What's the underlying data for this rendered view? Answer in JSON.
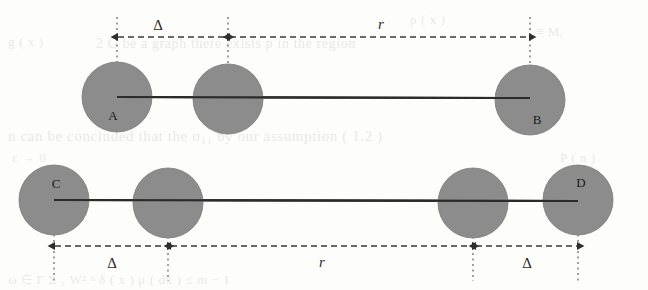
{
  "figure": {
    "name": "two-row-sphere-separation-diagram",
    "background_color": "#fdfdfc",
    "circle_fill": "#8c8c8c",
    "circle_stroke": "#6f6f6f",
    "line_color": "#2b2b2b",
    "dim_color": "#3a3a3a",
    "labels": {
      "delta": "Δ",
      "r": "r",
      "a": "A",
      "b": "B",
      "c": "C",
      "d": "D"
    },
    "rows": [
      {
        "id": "top-row",
        "endpoint_labels": [
          "A",
          "B"
        ],
        "dimensions": [
          {
            "symbol": "Δ",
            "from": "A",
            "to": "inner-left"
          },
          {
            "symbol": "r",
            "from": "inner-left",
            "to": "B"
          }
        ],
        "circles": [
          {
            "id": "circle-a",
            "cx": 117,
            "cy": 97,
            "r": 35,
            "label": "A"
          },
          {
            "id": "circle-top-inner",
            "cx": 228,
            "cy": 99,
            "r": 35,
            "label": ""
          },
          {
            "id": "circle-b",
            "cx": 530,
            "cy": 100,
            "r": 35,
            "label": "B"
          }
        ]
      },
      {
        "id": "bottom-row",
        "endpoint_labels": [
          "C",
          "D"
        ],
        "dimensions": [
          {
            "symbol": "Δ",
            "from": "C",
            "to": "inner-left"
          },
          {
            "symbol": "r",
            "from": "inner-left",
            "to": "inner-right"
          },
          {
            "symbol": "Δ",
            "from": "inner-right",
            "to": "D"
          }
        ],
        "circles": [
          {
            "id": "circle-c",
            "cx": 54,
            "cy": 200,
            "r": 35,
            "label": "C"
          },
          {
            "id": "circle-bottom-inner-left",
            "cx": 168,
            "cy": 203,
            "r": 35,
            "label": ""
          },
          {
            "id": "circle-bottom-inner-right",
            "cx": 473,
            "cy": 203,
            "r": 35,
            "label": ""
          },
          {
            "id": "circle-d",
            "cx": 578,
            "cy": 200,
            "r": 35,
            "label": "D"
          }
        ]
      }
    ]
  },
  "background_bleed": {
    "visible": true,
    "lines": [
      {
        "text": "n can be concluded that the  σ₁₁   by our assumption ( 1.2 )",
        "x": 8,
        "y": 128,
        "size": 15
      },
      {
        "text": "2 G be a graph  there  exists  p  in  the  region",
        "x": 96,
        "y": 36,
        "size": 14
      },
      {
        "text": "ρ ( x )",
        "x": 410,
        "y": 12,
        "size": 13
      },
      {
        "text": "g ( x )",
        "x": 8,
        "y": 34,
        "size": 13
      },
      {
        "text": "ω ∈ Γ         Σ ₁ W² ⁿ      δ ( x ) μ ( dx )      ≤ m − 1",
        "x": 8,
        "y": 272,
        "size": 13
      },
      {
        "text": "≡ Mᵢ",
        "x": 536,
        "y": 24,
        "size": 13
      },
      {
        "text": "ε → 0",
        "x": 12,
        "y": 150,
        "size": 13
      },
      {
        "text": "P ( n )",
        "x": 560,
        "y": 150,
        "size": 13
      }
    ]
  }
}
